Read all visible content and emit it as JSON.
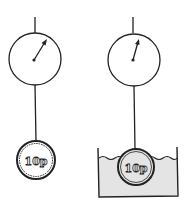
{
  "diagram": {
    "left": {
      "label": "in-air",
      "coin_text": "10p"
    },
    "right": {
      "label": "in-water",
      "coin_text": "10p"
    },
    "colors": {
      "ink": "#222222",
      "water": "#e4e4e4",
      "background": "#ffffff"
    }
  }
}
